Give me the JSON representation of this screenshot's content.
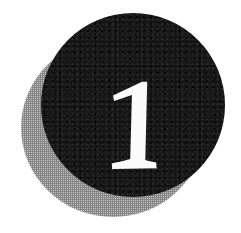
{
  "canvas": {
    "width": 241,
    "height": 233,
    "background_color": "#ffffff"
  },
  "graphic": {
    "kind": "chapter-number-badge",
    "description": "Large black circle with a white serif numeral, offset gray halftone shadow circle behind it",
    "numeral": "1",
    "numeral_color": "#fbfbfb",
    "numeral_style": "serif",
    "disc": {
      "label": "black-disc",
      "color": "#141414",
      "left": 41,
      "top": 13,
      "width": 184,
      "height": 184
    },
    "shadow_disc": {
      "label": "gray-halftone-shadow-disc",
      "color": "#9e9e9e",
      "left": 21,
      "top": 38,
      "width": 184,
      "height": 179
    }
  }
}
